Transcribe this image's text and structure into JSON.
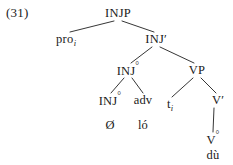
{
  "figure": {
    "example_number": "(31)",
    "type": "syntax-tree",
    "language_example": "Ø ló  ...  dù"
  },
  "tree": {
    "nodes": [
      {
        "id": "injp",
        "label": "INJP",
        "subscript": "",
        "x": 118,
        "y": 13,
        "kind": "phrase"
      },
      {
        "id": "pro",
        "label": "pro",
        "subscript": "i",
        "x": 66,
        "y": 39,
        "kind": "terminal"
      },
      {
        "id": "inj-bar",
        "label": "INJ",
        "prime": "′",
        "x": 156,
        "y": 39,
        "kind": "bar"
      },
      {
        "id": "inj0-mid",
        "label": "INJ",
        "degree": "°",
        "x": 128,
        "y": 70,
        "kind": "head"
      },
      {
        "id": "vp",
        "label": "VP",
        "x": 197,
        "y": 70,
        "kind": "phrase"
      },
      {
        "id": "inj0-leaf",
        "label": "INJ",
        "degree": "°",
        "x": 110,
        "y": 100,
        "kind": "head"
      },
      {
        "id": "adv",
        "label": "adv",
        "x": 143,
        "y": 100,
        "kind": "head"
      },
      {
        "id": "trace",
        "label": "t",
        "subscript": "i",
        "x": 170,
        "y": 104,
        "kind": "trace"
      },
      {
        "id": "v-bar",
        "label": "V",
        "prime": "′",
        "x": 218,
        "y": 100,
        "kind": "bar"
      },
      {
        "id": "null-morph",
        "label": "Ø",
        "x": 110,
        "y": 125,
        "kind": "word"
      },
      {
        "id": "lo",
        "label": "ló",
        "x": 143,
        "y": 125,
        "kind": "word"
      },
      {
        "id": "v0",
        "label": "V",
        "degree": "°",
        "x": 213,
        "y": 139,
        "kind": "head"
      },
      {
        "id": "du",
        "label": "dù",
        "x": 213,
        "y": 155,
        "kind": "word"
      }
    ],
    "edges": [
      {
        "from": "injp",
        "to": "pro",
        "x1": 114,
        "y1": 21,
        "x2": 70,
        "y2": 32
      },
      {
        "from": "injp",
        "to": "inj-bar",
        "x1": 122,
        "y1": 21,
        "x2": 154,
        "y2": 32
      },
      {
        "from": "inj-bar",
        "to": "inj0-mid",
        "x1": 152,
        "y1": 47,
        "x2": 131,
        "y2": 63
      },
      {
        "from": "inj-bar",
        "to": "vp",
        "x1": 160,
        "y1": 47,
        "x2": 194,
        "y2": 63
      },
      {
        "from": "inj0-mid",
        "to": "inj0-leaf",
        "x1": 124,
        "y1": 78,
        "x2": 111,
        "y2": 93
      },
      {
        "from": "inj0-mid",
        "to": "adv",
        "x1": 132,
        "y1": 78,
        "x2": 143,
        "y2": 93
      },
      {
        "from": "vp",
        "to": "trace",
        "x1": 193,
        "y1": 78,
        "x2": 172,
        "y2": 97
      },
      {
        "from": "vp",
        "to": "v-bar",
        "x1": 201,
        "y1": 78,
        "x2": 216,
        "y2": 93
      },
      {
        "from": "v-bar",
        "to": "v0",
        "x1": 214,
        "y1": 108,
        "x2": 213,
        "y2": 132
      }
    ],
    "colors": {
      "line": "#1f1f1f",
      "text": "#1a1a1a",
      "background": "#ffffff"
    }
  }
}
